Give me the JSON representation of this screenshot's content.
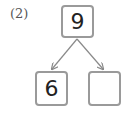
{
  "problem_label": "(2)",
  "tree": {
    "root": {
      "value": "9"
    },
    "children": [
      {
        "value": "6"
      },
      {
        "value": ""
      }
    ]
  },
  "colors": {
    "border": "#9a9a9a",
    "arrow": "#8a8a8a",
    "text": "#222222"
  }
}
